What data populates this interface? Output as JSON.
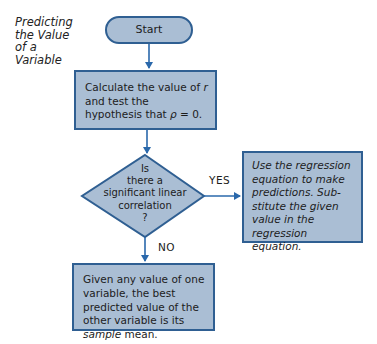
{
  "diagram": {
    "title": "Predicting\nthe Value\nof a\nVariable",
    "nodes": {
      "start": {
        "label": "Start"
      },
      "calculate": {
        "text_1": "Calculate the value of ",
        "var_r": "r",
        "text_2": " and test the hypothesis that ",
        "rho": "ρ",
        "text_3": " = 0."
      },
      "decision": {
        "label": "Is\nthere a\nsignificant linear\ncorrelation\n?"
      },
      "yes_box": {
        "text": "Use the regression equation to make predictions. Sub-stitute the given value in the regression equation."
      },
      "no_box": {
        "text_1": "Given any value of one variable, the best predicted value of the other variable is its ",
        "emphasis": "sample",
        "text_2": " mean."
      }
    },
    "edge_labels": {
      "yes": "YES",
      "no": "NO"
    },
    "colors": {
      "fill": "#aabed4",
      "border": "#2f5f92",
      "arrow": "#2a68ab"
    }
  }
}
